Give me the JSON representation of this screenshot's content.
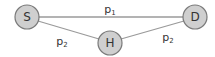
{
  "diagram": {
    "nodes": [
      {
        "id": "S",
        "label": "S",
        "cx": 27,
        "cy": 17,
        "r": 12
      },
      {
        "id": "H",
        "label": "H",
        "cx": 110,
        "cy": 43,
        "r": 12
      },
      {
        "id": "D",
        "label": "D",
        "cx": 195,
        "cy": 17,
        "r": 12
      }
    ],
    "edges": [
      {
        "from": "S",
        "to": "D",
        "label_base": "p",
        "label_sub": "1"
      },
      {
        "from": "S",
        "to": "H",
        "label_base": "p",
        "label_sub": "2"
      },
      {
        "from": "H",
        "to": "D",
        "label_base": "p",
        "label_sub": "2"
      }
    ],
    "colors": {
      "node_fill": "#cfcfcf",
      "node_stroke": "#7a7a7a",
      "edge": "#9a9a9a",
      "text": "#333333"
    }
  }
}
